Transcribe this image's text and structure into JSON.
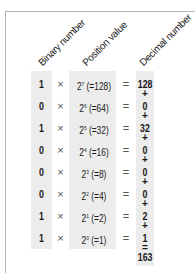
{
  "headers": {
    "binary": "Binary number",
    "position": "Position value",
    "decimal": "Decimal number"
  },
  "operators": {
    "times": "×",
    "equals": "=",
    "plus": "+"
  },
  "rows": [
    {
      "bit": "1",
      "base": "2",
      "exp": "7",
      "value": "(=128)",
      "decimal": "128"
    },
    {
      "bit": "0",
      "base": "2",
      "exp": "6",
      "value": "(=64)",
      "decimal": "0"
    },
    {
      "bit": "1",
      "base": "2",
      "exp": "5",
      "value": "(=32)",
      "decimal": "32"
    },
    {
      "bit": "0",
      "base": "2",
      "exp": "4",
      "value": "(=16)",
      "decimal": "0"
    },
    {
      "bit": "0",
      "base": "2",
      "exp": "3",
      "value": "(=8)",
      "decimal": "0"
    },
    {
      "bit": "0",
      "base": "2",
      "exp": "2",
      "value": "(=4)",
      "decimal": "0"
    },
    {
      "bit": "1",
      "base": "2",
      "exp": "1",
      "value": "(=2)",
      "decimal": "2"
    },
    {
      "bit": "1",
      "base": "2",
      "exp": "0",
      "value": "(=1)",
      "decimal": "1"
    }
  ],
  "total": {
    "equals": "=",
    "value": "163"
  },
  "colors": {
    "column_shade": "#ececec",
    "frame": "#b5b5b5",
    "text": "#1a1a1a"
  }
}
